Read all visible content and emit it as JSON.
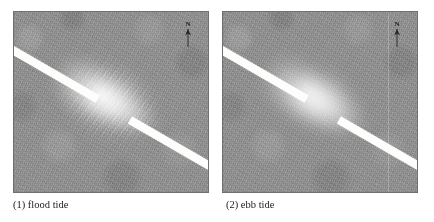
{
  "figure": {
    "background_color": "#ffffff",
    "panel_background_color": "#8c8c8c",
    "feature_color": "#fdfdfb"
  },
  "panels": [
    {
      "id": "flood-tide",
      "caption": "(1) flood tide",
      "north_arrow_label": "N",
      "bar_tag_label": "",
      "plume_texture": "streaky"
    },
    {
      "id": "ebb-tide",
      "caption": "(2) ebb tide",
      "north_arrow_label": "N",
      "bar_tag_label": "",
      "plume_texture": "diffuse"
    }
  ]
}
